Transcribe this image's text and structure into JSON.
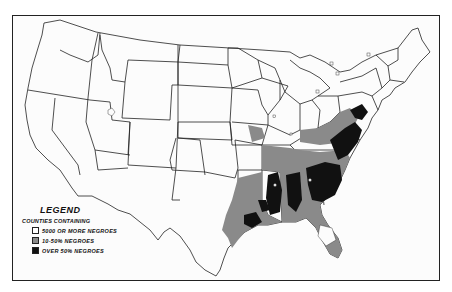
{
  "map": {
    "subject": "Counties of the United States by Negro population",
    "region": "Contiguous United States"
  },
  "legend": {
    "title": "LEGEND",
    "subtitle": "COUNTIES CONTAINING",
    "items": [
      {
        "label": "5000 OR MORE NEGROES",
        "color": "#ffffff"
      },
      {
        "label": "10-50% NEGROES",
        "color": "#8a8a8a"
      },
      {
        "label": "OVER 50% NEGROES",
        "color": "#111111"
      }
    ]
  },
  "colors": {
    "outline": "#222222",
    "medium": "#8a8a8a",
    "dark": "#111111",
    "background": "#fcfcfc"
  }
}
